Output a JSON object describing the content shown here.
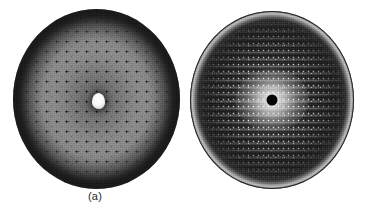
{
  "figure": {
    "kind": "x-ray-diffraction-pattern-pair",
    "background_color": "#ffffff",
    "width_px": 369,
    "height_px": 217,
    "panels": [
      {
        "id": "a",
        "caption": "(a)",
        "polarity": "negative",
        "description": "Light-grey circular diffraction plate with a regular square lattice of dark reflection spots and a bright white beam-stop shadow at the centre.",
        "plate": {
          "shape": "circle",
          "center_x_px": 96,
          "center_y_px": 99,
          "diameter_px": 174,
          "rim_color": "#343434",
          "field_color": "#8c8c8c",
          "inner_halo_color": "#6a6a6a"
        },
        "spots": {
          "color": "#000000",
          "lattice": "square",
          "spacing_px": 10,
          "shape": "round"
        },
        "beamstop": {
          "color": "#ffffff",
          "width_px": 13,
          "height_px": 16,
          "offset_x_px": -3,
          "offset_y_px": -3
        }
      },
      {
        "id": "b",
        "caption": "(b)",
        "polarity": "positive",
        "description": "Dark circular diffraction plate with rows of bright reflection spots, a bright central halo and a black beam-stop disc at the centre; bright outer rim.",
        "plate": {
          "shape": "circle",
          "center_x_px": 272,
          "center_y_px": 100,
          "diameter_px": 166,
          "rim_color": "#bdbdbd",
          "field_color": "#1a1a1a",
          "inner_halo_color": "#cfcfcf"
        },
        "spots": {
          "color": "#ffffff",
          "lattice": "rectangular",
          "spacing_x_px": 5,
          "spacing_y_px": 7,
          "shape": "round"
        },
        "beamstop": {
          "color": "#000000",
          "diameter_px": 11,
          "offset_x_px": 0,
          "offset_y_px": 0
        }
      }
    ]
  }
}
